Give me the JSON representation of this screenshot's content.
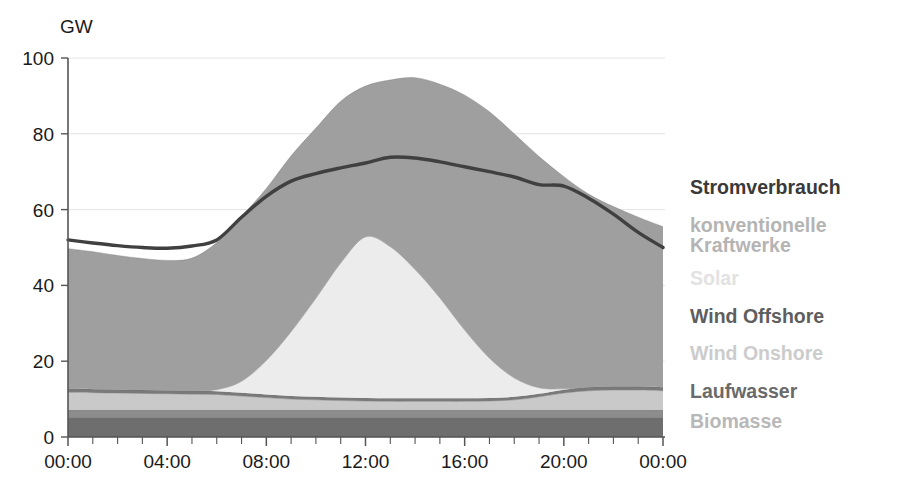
{
  "chart_data": {
    "type": "area",
    "title": "",
    "subtitle": "",
    "xlabel": "",
    "ylabel": "GW",
    "unit": "GW",
    "ylim": [
      0,
      100
    ],
    "yticks": [
      0,
      20,
      40,
      60,
      80,
      100
    ],
    "ytick_labels": [
      "0",
      "20",
      "40",
      "60",
      "80",
      "100"
    ],
    "xlim": [
      0,
      24
    ],
    "xticks": [
      0,
      4,
      8,
      12,
      16,
      20,
      24
    ],
    "xtick_labels": [
      "00:00",
      "04:00",
      "08:00",
      "12:00",
      "16:00",
      "20:00",
      "00:00"
    ],
    "minor_xticks_hourly": true,
    "grid": "horizontal-light",
    "legend_position": "right",
    "stacked": true,
    "x": [
      0,
      1,
      2,
      3,
      4,
      5,
      6,
      7,
      8,
      9,
      10,
      11,
      12,
      13,
      14,
      15,
      16,
      17,
      18,
      19,
      20,
      21,
      22,
      23,
      24
    ],
    "series": [
      {
        "name": "Biomasse",
        "color": "#6e6e6e",
        "values": [
          5.2,
          5.2,
          5.2,
          5.2,
          5.2,
          5.2,
          5.2,
          5.2,
          5.2,
          5.2,
          5.2,
          5.2,
          5.2,
          5.2,
          5.2,
          5.2,
          5.2,
          5.2,
          5.2,
          5.2,
          5.2,
          5.2,
          5.2,
          5.2,
          5.2
        ]
      },
      {
        "name": "Laufwasser",
        "color": "#8c8c8c",
        "values": [
          2.0,
          2.0,
          2.0,
          2.0,
          2.0,
          2.0,
          2.0,
          2.0,
          2.0,
          2.0,
          2.0,
          2.0,
          2.0,
          2.0,
          2.0,
          2.0,
          2.0,
          2.0,
          2.0,
          2.0,
          2.0,
          2.0,
          2.0,
          2.0,
          2.0
        ]
      },
      {
        "name": "Wind Onshore",
        "color": "#c9c9c9",
        "values": [
          4.6,
          4.5,
          4.4,
          4.3,
          4.2,
          4.1,
          4.0,
          3.6,
          3.2,
          2.8,
          2.6,
          2.4,
          2.3,
          2.2,
          2.2,
          2.2,
          2.2,
          2.3,
          2.6,
          3.4,
          4.4,
          5.0,
          5.2,
          5.2,
          5.0
        ]
      },
      {
        "name": "Wind Offshore",
        "color": "#7a7a7a",
        "values": [
          0.9,
          0.9,
          0.9,
          0.9,
          0.9,
          0.9,
          0.9,
          0.9,
          0.8,
          0.8,
          0.8,
          0.8,
          0.8,
          0.8,
          0.8,
          0.8,
          0.8,
          0.8,
          0.8,
          0.8,
          0.9,
          0.9,
          0.9,
          0.9,
          0.9
        ]
      },
      {
        "name": "Solar",
        "color": "#ececec",
        "values": [
          0,
          0,
          0,
          0,
          0,
          0,
          0.4,
          3.0,
          9.0,
          17.0,
          26.0,
          35.5,
          42.5,
          40.0,
          34.0,
          26.5,
          18.0,
          10.5,
          5.0,
          1.6,
          0.2,
          0,
          0,
          0,
          0
        ]
      },
      {
        "name": "konventionelle Kraftwerke",
        "color": "#9f9f9f",
        "values": [
          37.0,
          36.3,
          35.4,
          34.7,
          34.3,
          35.0,
          38.8,
          43.5,
          45.4,
          46.4,
          44.9,
          42.7,
          39.8,
          44.0,
          50.6,
          56.4,
          62.0,
          65.0,
          64.4,
          61.0,
          56.0,
          51.0,
          47.5,
          44.7,
          42.4
        ]
      }
    ],
    "stack_top_envelope": [
      49.7,
      48.9,
      47.9,
      47.1,
      46.6,
      47.2,
      51.3,
      58.2,
      65.6,
      74.2,
      81.5,
      88.6,
      92.6,
      94.2,
      94.8,
      93.1,
      90.2,
      86.4,
      80.0,
      74.0,
      68.7,
      64.1,
      60.8,
      58.0,
      55.5
    ],
    "line_series": {
      "name": "Stromverbrauch",
      "color": "#404040",
      "values": [
        52.0,
        51.2,
        50.5,
        50.0,
        49.8,
        50.4,
        52.0,
        58.0,
        63.5,
        67.5,
        69.5,
        71.0,
        72.3,
        73.8,
        73.6,
        72.6,
        71.3,
        70.0,
        68.6,
        66.6,
        66.2,
        63.0,
        58.8,
        54.0,
        50.0
      ]
    }
  },
  "legend": {
    "items": [
      {
        "label": "Stromverbrauch",
        "color": "#3a3a3a"
      },
      {
        "label": "konventionelle",
        "color": "#b4b4b4"
      },
      {
        "label": "Kraftwerke",
        "color": "#b4b4b4"
      },
      {
        "label": "Solar",
        "color": "#e2e2e2"
      },
      {
        "label": "Wind Offshore",
        "color": "#5e5e5e"
      },
      {
        "label": "Wind Onshore",
        "color": "#cccccc"
      },
      {
        "label": "Laufwasser",
        "color": "#6a6a6a"
      },
      {
        "label": "Biomasse",
        "color": "#b8b8b8"
      }
    ]
  },
  "axes": {
    "unit_label": "GW",
    "y_tick_labels": [
      "100",
      "80",
      "60",
      "40",
      "20",
      "0"
    ],
    "x_tick_labels": [
      "00:00",
      "04:00",
      "08:00",
      "12:00",
      "16:00",
      "20:00",
      "00:00"
    ]
  },
  "colors": {
    "background": "#ffffff",
    "axis": "#555555",
    "grid": "#e4e4e4",
    "consumption_line": "#404040"
  }
}
